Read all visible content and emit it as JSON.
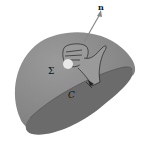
{
  "figure": {
    "labels": {
      "normal": "n",
      "surface": "Σ",
      "curve": "C"
    },
    "colors": {
      "surface_light": "#8c8c8c",
      "surface_dark": "#6e6e6e",
      "hand_fill": "#9a9a9a",
      "thumb_highlight": "#e8e8e8",
      "stroke": "#222222",
      "arrow": "#888888"
    }
  }
}
